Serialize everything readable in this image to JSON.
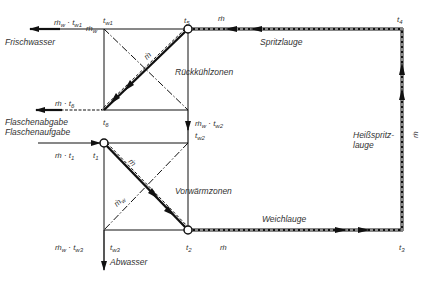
{
  "diagram": {
    "colors": {
      "line": "#111111",
      "text": "#333333",
      "background": "#ffffff"
    },
    "zones": {
      "upper": "Rückkühlzonen",
      "lower": "Vorwärmzonen"
    },
    "streams": {
      "fresh_water": "Frischwasser",
      "bottle_out": "Flaschenabgabe",
      "bottle_in": "Flaschenaufgabe",
      "waste_water": "Abwasser",
      "spray_lye": "Spritzlauge",
      "hot_spray_lye_line1": "Heißspritz-",
      "hot_spray_lye_line2": "lauge",
      "soak_lye": "Weichlauge"
    },
    "symbols": {
      "mdot": "ṁ",
      "mw_tw1": {
        "base": "ṁ",
        "s1": "w",
        "mid": " · t",
        "s2": "w1"
      },
      "mw_tw2": {
        "base": "ṁ",
        "s1": "w",
        "mid": " · t",
        "s2": "w2"
      },
      "mw_tw3": {
        "base": "ṁ",
        "s1": "w",
        "mid": " · t",
        "s2": "w3"
      },
      "m_t6": {
        "base": "ṁ · t",
        "s": "6"
      },
      "m_t1": {
        "base": "ṁ · t",
        "s": "1"
      },
      "mw_diag": {
        "base": "ṁ",
        "s": "w"
      },
      "mw_top_extra": {
        "base": "ṁ",
        "s": "w"
      },
      "t_w1": {
        "base": "t",
        "s": "w1"
      },
      "t_w2": {
        "base": "t",
        "s": "w2"
      },
      "t_w3": {
        "base": "t",
        "s": "w3"
      },
      "t1": {
        "base": "t",
        "s": "1"
      },
      "t2": {
        "base": "t",
        "s": "2"
      },
      "t3": {
        "base": "t",
        "s": "3"
      },
      "t4": {
        "base": "t",
        "s": "4"
      },
      "t5": {
        "base": "t",
        "s": "5"
      },
      "t6": {
        "base": "t",
        "s": "6"
      }
    }
  }
}
